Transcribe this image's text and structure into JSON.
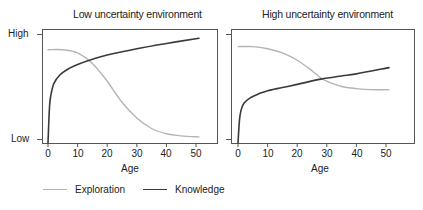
{
  "panels": [
    {
      "title": "Low uncertainty environment",
      "xlabel": "Age",
      "x_ticks": [
        "0",
        "10",
        "20",
        "30",
        "40",
        "50"
      ],
      "y_ticks": [
        "High",
        "Low"
      ]
    },
    {
      "title": "High uncertainty environment",
      "xlabel": "Age",
      "x_ticks": [
        "0",
        "10",
        "20",
        "30",
        "40",
        "50"
      ],
      "y_ticks": [
        "",
        ""
      ]
    }
  ],
  "legend": {
    "exploration": "Exploration",
    "knowledge": "Knowledge"
  },
  "colors": {
    "exploration": "#b4b4b4",
    "knowledge": "#3a3a3a",
    "frame": "#555555"
  },
  "chart_data": [
    {
      "type": "line",
      "title": "Low uncertainty environment",
      "xlabel": "Age",
      "ylabel": "",
      "xlim": [
        -2,
        57
      ],
      "ylim": [
        "Low",
        "High"
      ],
      "y_scale_note": "0 = Low, 1 = High (relative)",
      "x_ticks": [
        0,
        10,
        20,
        30,
        40,
        50
      ],
      "y_tick_labels": [
        "Low",
        "High"
      ],
      "grid": false,
      "legend_position": "bottom",
      "series": [
        {
          "name": "Exploration",
          "x": [
            0,
            5,
            10,
            15,
            20,
            25,
            30,
            35,
            40,
            45,
            51
          ],
          "values": [
            0.85,
            0.85,
            0.82,
            0.72,
            0.55,
            0.35,
            0.2,
            0.1,
            0.05,
            0.03,
            0.02
          ]
        },
        {
          "name": "Knowledge",
          "x": [
            0,
            0.5,
            1,
            2,
            4,
            7,
            10,
            15,
            20,
            30,
            40,
            51
          ],
          "values": [
            0.0,
            0.3,
            0.42,
            0.53,
            0.61,
            0.67,
            0.71,
            0.76,
            0.8,
            0.86,
            0.91,
            0.96
          ]
        }
      ]
    },
    {
      "type": "line",
      "title": "High uncertainty environment",
      "xlabel": "Age",
      "ylabel": "",
      "xlim": [
        -2,
        57
      ],
      "ylim": [
        "Low",
        "High"
      ],
      "y_scale_note": "0 = Low, 1 = High (relative)",
      "x_ticks": [
        0,
        10,
        20,
        30,
        40,
        50
      ],
      "y_tick_labels": [
        "",
        ""
      ],
      "grid": false,
      "legend_position": "bottom",
      "series": [
        {
          "name": "Exploration",
          "x": [
            0,
            5,
            10,
            15,
            20,
            25,
            28,
            30,
            35,
            40,
            45,
            51
          ],
          "values": [
            0.88,
            0.88,
            0.86,
            0.82,
            0.75,
            0.65,
            0.58,
            0.55,
            0.5,
            0.48,
            0.47,
            0.47
          ]
        },
        {
          "name": "Knowledge",
          "x": [
            0,
            0.5,
            1,
            2,
            4,
            7,
            10,
            15,
            20,
            28,
            35,
            40,
            51
          ],
          "values": [
            0.0,
            0.18,
            0.27,
            0.34,
            0.39,
            0.43,
            0.46,
            0.49,
            0.52,
            0.57,
            0.6,
            0.62,
            0.68
          ]
        }
      ]
    }
  ]
}
